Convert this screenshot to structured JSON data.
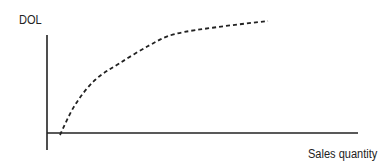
{
  "chart_data": {
    "type": "line",
    "title": "",
    "xlabel": "Sales quantity",
    "ylabel": "DOL",
    "grid": false,
    "legend": null,
    "x_ticks": [],
    "y_ticks": [],
    "series": [
      {
        "name": "DOL curve",
        "style": "dashed",
        "color": "#222222",
        "description": "Concave increasing curve starting at the x-axis near the origin and flattening toward an asymptote",
        "points_px": [
          [
            60,
            135
          ],
          [
            75,
            105
          ],
          [
            95,
            80
          ],
          [
            120,
            63
          ],
          [
            150,
            45
          ],
          [
            175,
            34
          ],
          [
            218,
            27
          ],
          [
            268,
            21
          ]
        ]
      }
    ],
    "axes": {
      "x_axis": {
        "from": [
          47,
          133
        ],
        "to": [
          358,
          133
        ]
      },
      "y_axis": {
        "from": [
          47,
          35
        ],
        "to": [
          47,
          150
        ]
      }
    }
  },
  "labels": {
    "y_axis": "DOL",
    "x_axis": "Sales quantity"
  },
  "colors": {
    "axis": "#222222",
    "curve": "#222222",
    "background": "#ffffff"
  }
}
